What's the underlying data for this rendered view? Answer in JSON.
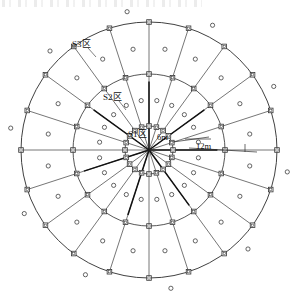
{
  "figure": {
    "type": "radial-zone-diagram",
    "canvas": {
      "width": 291,
      "height": 301
    },
    "center": {
      "x": 149,
      "y": 150
    },
    "background_color": "#ffffff",
    "line_color": "#2b2b2b",
    "marker_stroke": "#333333",
    "marker_fill": "#ffffff"
  },
  "labels": {
    "zone_outer": "S3区",
    "zone_middle": "S2区",
    "zone_inner": "S1区",
    "dim_inner": "6m",
    "dim_outer": "12m"
  },
  "chart_data": {
    "type": "scatter",
    "xlabel": "",
    "ylabel": "",
    "coordinate_system": "polar",
    "center": {
      "x": 149,
      "y": 150
    },
    "rings": [
      {
        "name": "S1区",
        "radius_px": 24,
        "radius_label": "6m",
        "label": "S1区"
      },
      {
        "name": "S2区",
        "radius_px": 76,
        "radius_label": "12m",
        "label": "S2区"
      },
      {
        "name": "S3区",
        "radius_px": 128,
        "radius_label": "",
        "label": "S3区"
      }
    ],
    "ray_count": 20,
    "ray_angles_deg": [
      0,
      18,
      36,
      54,
      72,
      90,
      108,
      126,
      144,
      162,
      180,
      198,
      216,
      234,
      252,
      270,
      288,
      306,
      324,
      342
    ],
    "square_marker_radii_px": [
      24,
      76,
      128
    ],
    "circle_marker_radii_px": [
      50,
      102,
      140
    ],
    "circle_marker_angle_offset_deg": 9,
    "annotations": [
      {
        "text": "6m",
        "radius_px": 24,
        "angle_deg": 2
      },
      {
        "text": "12m",
        "radius_px": 76,
        "angle_deg": 2
      }
    ],
    "legend": [],
    "grid": false
  }
}
